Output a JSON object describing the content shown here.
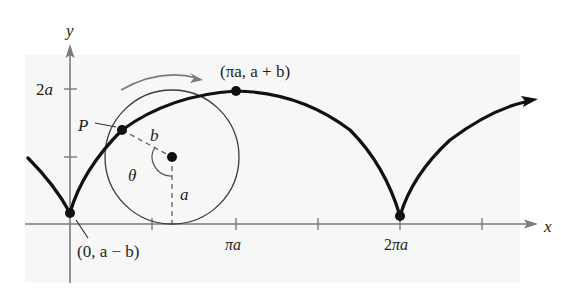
{
  "figure": {
    "background_panel_color": "#f7f7f7",
    "axis_color": "#7a7a7a",
    "curve_color": "#111111",
    "circle_color": "#3a3a3a",
    "arrow_color": "#7a7a7a"
  },
  "axes": {
    "x_label": "x",
    "y_label": "y",
    "y_ticks": [
      {
        "label": "2a",
        "value": "2a"
      },
      {
        "label": "",
        "value": "a"
      }
    ],
    "x_ticks": [
      {
        "label": "",
        "value": "πa/2"
      },
      {
        "label": "πa",
        "value": "πa"
      },
      {
        "label": "",
        "value": "3πa/2"
      },
      {
        "label": "2πa",
        "value": "2πa"
      },
      {
        "label": "",
        "value": "5πa/2"
      }
    ]
  },
  "labels": {
    "point_p": "P",
    "radius_b": "b",
    "radius_a": "a",
    "angle": "θ",
    "peak_point": "(πa, a + b)",
    "start_point": "(0, a − b)",
    "tick_2a": "2a",
    "tick_pi_a": "πa",
    "tick_2pi_a": "2πa"
  },
  "points": [
    {
      "name": "P",
      "description": "tracing point on curve"
    },
    {
      "name": "circle-center",
      "description": "center of rolling circle"
    },
    {
      "name": "peak",
      "coords": "(πa, a + b)"
    },
    {
      "name": "start",
      "coords": "(0, a − b)"
    },
    {
      "name": "cusp-2pi",
      "coords": "(2πa, a − b)"
    }
  ]
}
